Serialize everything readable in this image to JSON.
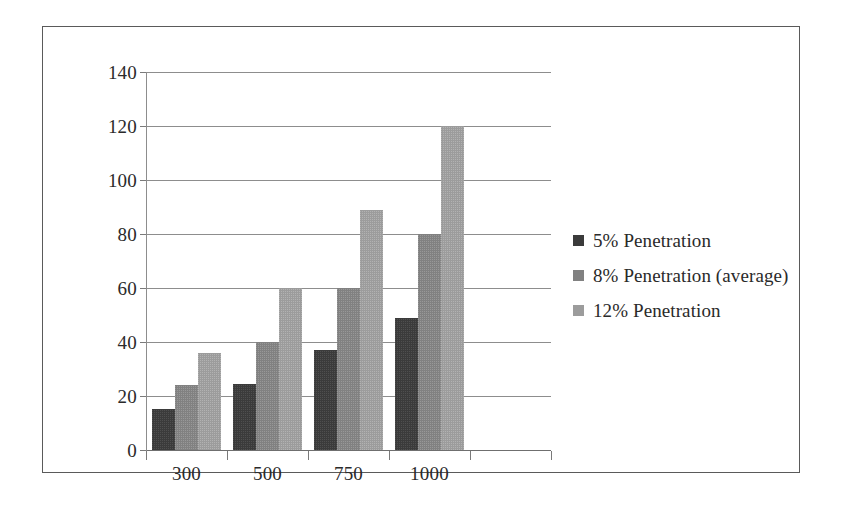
{
  "chart_data": {
    "type": "bar",
    "title": "",
    "subtitle": "",
    "xlabel": "",
    "ylabel": "",
    "categories": [
      "300",
      "500",
      "750",
      "1000"
    ],
    "series": [
      {
        "name": "5% Penetration",
        "color": "#3b3b3b",
        "values": [
          15,
          24.5,
          37,
          49
        ]
      },
      {
        "name": "8% Penetration (average)",
        "color": "#818181",
        "values": [
          24,
          40,
          60,
          80
        ]
      },
      {
        "name": "12% Penetration",
        "color": "#9c9c9c",
        "values": [
          36,
          60,
          89,
          120
        ]
      }
    ],
    "ylim": [
      0,
      140
    ],
    "yticks": [
      0,
      20,
      40,
      60,
      80,
      100,
      120,
      140
    ],
    "ytick_labels": [
      "0",
      "20",
      "40",
      "60",
      "80",
      "100",
      "120",
      "140"
    ],
    "grid": true,
    "grid_axis": "y",
    "legend_position": "right",
    "frame": true
  },
  "colors": {
    "series_dark": "#3b3b3b",
    "series_medium": "#818181",
    "series_light": "#9c9c9c",
    "gridline": "#8d8d8d",
    "axis": "#8d8d8d",
    "frame_border": "#5a5a5a",
    "text": "#2a2a2a",
    "background": "#ffffff"
  }
}
